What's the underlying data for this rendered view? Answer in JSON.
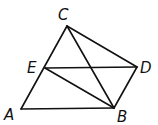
{
  "diagram": {
    "type": "geometry",
    "points": {
      "A": {
        "x": 21,
        "y": 109,
        "label": "A",
        "lx": 4,
        "ly": 120
      },
      "B": {
        "x": 114,
        "y": 108,
        "label": "B",
        "lx": 117,
        "ly": 122
      },
      "C": {
        "x": 67,
        "y": 26,
        "label": "C",
        "lx": 58,
        "ly": 20
      },
      "D": {
        "x": 137,
        "y": 67,
        "label": "D",
        "lx": 140,
        "ly": 73
      },
      "E": {
        "x": 45,
        "y": 68,
        "label": "E",
        "lx": 27,
        "ly": 73
      }
    },
    "segments": [
      [
        "A",
        "B"
      ],
      [
        "A",
        "C"
      ],
      [
        "C",
        "B"
      ],
      [
        "C",
        "D"
      ],
      [
        "E",
        "D"
      ],
      [
        "E",
        "B"
      ],
      [
        "D",
        "B"
      ]
    ],
    "stroke_color": "#111111"
  }
}
